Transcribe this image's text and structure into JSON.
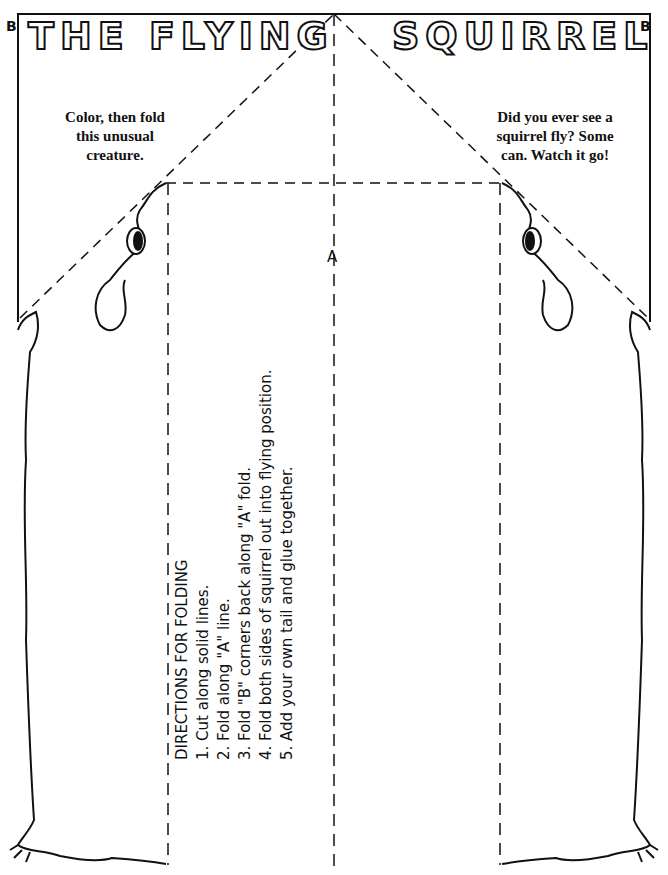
{
  "title": {
    "left": "THE FLYING",
    "right": "SQUIRREL"
  },
  "corner_labels": {
    "left": "B",
    "right": "B"
  },
  "notes": {
    "left": [
      "Color, then fold",
      "this unusual",
      "creature."
    ],
    "right": [
      "Did you ever see a",
      "squirrel fly? Some",
      "can. Watch it go!"
    ]
  },
  "fold_label": "A",
  "directions": {
    "heading": "DIRECTIONS FOR FOLDING",
    "steps": [
      "1. Cut along solid lines.",
      "2. Fold along \"A\" line.",
      "3. Fold \"B\" corners back along \"A\" fold.",
      "4. Fold both sides of squirrel out into flying position.",
      "5. Add your own tail and glue together."
    ]
  }
}
